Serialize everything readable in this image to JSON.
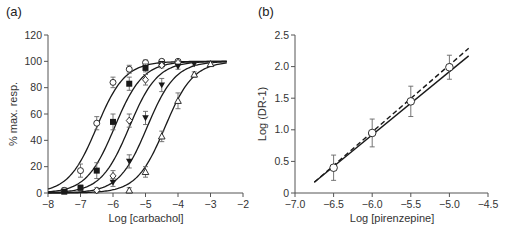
{
  "chart_data": [
    {
      "panel": "(a)",
      "type": "line",
      "title": "",
      "xlabel": "Log [carbachol]",
      "ylabel": "% max. resp.",
      "xlim": [
        -8,
        -2
      ],
      "ylim": [
        0,
        120
      ],
      "xticks": [
        -8,
        -7,
        -6,
        -5,
        -4,
        -3,
        -2
      ],
      "yticks": [
        0,
        20,
        40,
        60,
        80,
        100,
        120
      ],
      "grid": false,
      "legend": "none",
      "series": [
        {
          "name": "control",
          "marker": "open-circle",
          "logEC50": -6.5,
          "x": [
            -7.5,
            -7,
            -6.5,
            -6,
            -5.5,
            -5,
            -4.5,
            -4
          ],
          "values": [
            2,
            17,
            53,
            84,
            94,
            99,
            100,
            100
          ],
          "err": [
            2,
            5,
            5,
            4,
            3,
            2,
            1,
            1
          ]
        },
        {
          "name": "pirenzepine low",
          "marker": "filled-square",
          "logEC50": -5.95,
          "x": [
            -7.5,
            -7,
            -6.5,
            -6,
            -5.5,
            -5,
            -4.5
          ],
          "values": [
            1,
            4,
            17,
            54,
            83,
            95,
            98
          ],
          "err": [
            1,
            2,
            6,
            6,
            5,
            3,
            1
          ]
        },
        {
          "name": "pirenzepine mid",
          "marker": "open-diamond",
          "logEC50": -5.5,
          "x": [
            -6.5,
            -6,
            -5.5,
            -5,
            -4.5,
            -4
          ],
          "values": [
            2,
            13,
            55,
            86,
            97,
            99
          ],
          "err": [
            2,
            4,
            5,
            4,
            2,
            1
          ]
        },
        {
          "name": "pirenzepine high",
          "marker": "filled-inverted-triangle",
          "logEC50": -4.95,
          "x": [
            -6,
            -5.5,
            -5,
            -4.5,
            -4,
            -3.5
          ],
          "values": [
            8,
            24,
            57,
            82,
            96,
            98
          ],
          "err": [
            3,
            5,
            5,
            5,
            2,
            1
          ]
        },
        {
          "name": "pirenzepine max",
          "marker": "open-triangle",
          "logEC50": -4.4,
          "x": [
            -5.5,
            -5,
            -4.5,
            -4,
            -3.5,
            -3
          ],
          "values": [
            2,
            16,
            43,
            70,
            90,
            98
          ],
          "err": [
            2,
            4,
            4,
            6,
            2,
            1
          ]
        }
      ],
      "curve_range": [
        -8,
        -2.5
      ]
    },
    {
      "panel": "(b)",
      "type": "line",
      "title": "",
      "xlabel": "Log [pirenzepine]",
      "ylabel": "Log (DR-1)",
      "xlim": [
        -7.0,
        -4.5
      ],
      "ylim": [
        0,
        2.5
      ],
      "xticks": [
        -7.0,
        -6.5,
        -6.0,
        -5.5,
        -5.0,
        -4.5
      ],
      "yticks": [
        0,
        0.5,
        1.0,
        1.5,
        2.0,
        2.5
      ],
      "grid": false,
      "legend": "none",
      "series": [
        {
          "name": "data",
          "marker": "open-circle",
          "x": [
            -6.5,
            -6.0,
            -5.5,
            -5.0
          ],
          "values": [
            0.4,
            0.95,
            1.45,
            1.99
          ],
          "err": [
            0.2,
            0.22,
            0.24,
            0.19
          ]
        },
        {
          "name": "regression",
          "style": "solid",
          "x": [
            -6.75,
            -4.75
          ],
          "values": [
            0.17,
            2.17
          ]
        },
        {
          "name": "unit slope",
          "style": "dashed",
          "x": [
            -6.75,
            -4.75
          ],
          "values": [
            0.17,
            2.29
          ]
        }
      ]
    }
  ],
  "labels": {
    "panel_a": "(a)",
    "panel_b": "(b)",
    "a_xlabel": "Log [carbachol]",
    "a_ylabel": "% max. resp.",
    "b_xlabel": "Log [pirenzepine]",
    "b_ylabel": "Log (DR-1)"
  },
  "colors": {
    "ink": "#1a1a1a",
    "axis": "#555555",
    "errbar": "#666666"
  }
}
